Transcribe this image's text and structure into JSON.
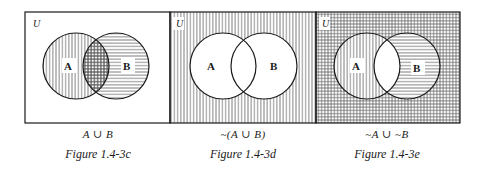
{
  "universe_label": "U",
  "set_a_label": "A",
  "set_b_label": "B",
  "colors": {
    "ink": "#1a1a1a",
    "paper": "#ffffff",
    "hatch": "#555555"
  },
  "figures": [
    {
      "expression": "A ∪ B",
      "caption": "Figure 1.4-3c",
      "shading": "A vertical hatch, B horizontal hatch, intersection crosshatched, outside blank"
    },
    {
      "expression": "~(A ∪ B)",
      "caption": "Figure 1.4-3d",
      "shading": "outside vertical hatch, A and B blank"
    },
    {
      "expression": "~A ∪ ~B",
      "caption": "Figure 1.4-3e",
      "shading": "outside crosshatched, A only vertical hatch, B only horizontal hatch, intersection blank"
    }
  ]
}
